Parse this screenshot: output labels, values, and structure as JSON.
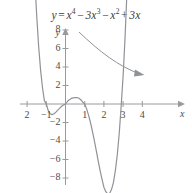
{
  "figure": {
    "equation_plain": "y = x^4 - 3x^3 - x^2 + 3x",
    "equation_parts": {
      "lhs": "y",
      "eq": "=",
      "t1_base": "x",
      "t1_exp": "4",
      "op1": "−",
      "t2_coef": "3",
      "t2_base": "x",
      "t2_exp": "3",
      "op2": "−",
      "t3_base": "x",
      "t3_exp": "2",
      "op3": "+",
      "t4": "3x"
    },
    "x_axis_name": "x",
    "y_axis_name": "y",
    "curve_color": "#8f9398",
    "axis_color": "#9a9a9a",
    "text_color": "#4a4a4a",
    "annotation": {
      "name": "curved-pointer-arrow",
      "color": "#8f9398",
      "points_to": "right branch of curve"
    }
  },
  "chart_data": {
    "type": "line",
    "xlabel": "x",
    "ylabel": "y",
    "xlim": [
      -2.5,
      4.4
    ],
    "ylim": [
      -9.5,
      9.2
    ],
    "grid": false,
    "legend": null,
    "x_ticks": [
      -2,
      -1,
      1,
      2,
      3,
      4
    ],
    "x_tick_labels": [
      "2",
      "−1",
      "1",
      "2",
      "3",
      "4"
    ],
    "y_ticks": [
      8,
      6,
      4,
      2,
      -2,
      -4,
      -6,
      -8
    ],
    "y_tick_labels": [
      "8",
      "6",
      "4",
      "2",
      "−2",
      "−4",
      "−6",
      "−8"
    ],
    "roots": [
      -1,
      0,
      1,
      3
    ],
    "local_max": {
      "x": 0.65,
      "y": 1.0
    },
    "local_min_left": {
      "x": -0.75,
      "y": -1.2
    },
    "local_min_right": {
      "x": 2.35,
      "y": -7.0
    },
    "series": [
      {
        "name": "y = x^4 - 3x^3 - x^2 + 3x",
        "x": [
          -1.55,
          -1.5,
          -1.4,
          -1.3,
          -1.2,
          -1.1,
          -1.0,
          -0.9,
          -0.8,
          -0.7,
          -0.6,
          -0.5,
          -0.4,
          -0.3,
          -0.2,
          -0.1,
          0.0,
          0.1,
          0.2,
          0.3,
          0.4,
          0.5,
          0.6,
          0.7,
          0.8,
          0.9,
          1.0,
          1.1,
          1.2,
          1.3,
          1.4,
          1.5,
          1.6,
          1.7,
          1.8,
          1.9,
          2.0,
          2.1,
          2.2,
          2.3,
          2.4,
          2.5,
          2.6,
          2.7,
          2.8,
          2.9,
          3.0,
          3.1,
          3.2,
          3.25
        ],
        "y": [
          11.53,
          9.56,
          6.27,
          3.72,
          1.78,
          0.36,
          0.0,
          -0.72,
          -1.06,
          -1.15,
          -1.06,
          -0.88,
          -0.66,
          -0.44,
          -0.25,
          -0.11,
          0.0,
          0.27,
          0.47,
          0.6,
          0.66,
          0.69,
          0.7,
          0.62,
          0.46,
          0.21,
          0.0,
          -0.53,
          -1.2,
          -2.0,
          -2.92,
          -3.94,
          -5.02,
          -6.12,
          -7.18,
          -8.13,
          -9.0,
          -9.48,
          -9.72,
          -9.65,
          -9.22,
          -8.44,
          -7.15,
          -5.43,
          -3.14,
          -0.2,
          3.0,
          7.12,
          12.06,
          14.79
        ],
        "color": "#8f9398",
        "linewidth": 1.2
      }
    ]
  }
}
